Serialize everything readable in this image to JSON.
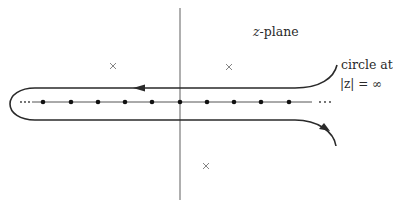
{
  "diagram": {
    "title": "z-plane",
    "plane_label": {
      "var": "z",
      "rest": "-plane"
    },
    "annotation": {
      "line1": "circle at",
      "line2": "|z| = ∞"
    },
    "axes": {
      "imaginary_axis": {
        "x": 180,
        "y1": 8,
        "y2": 200,
        "color": "#7a7a7a"
      },
      "real_axis": {
        "y": 102,
        "x1": 32,
        "x2": 312,
        "color": "#555555"
      }
    },
    "real_axis_points": [
      43,
      71,
      98,
      125,
      152,
      180,
      207,
      234,
      261,
      289
    ],
    "ellipsis_left": "···",
    "ellipsis_right": "···",
    "poles": [
      {
        "x": 113,
        "y": 66,
        "symbol": "×"
      },
      {
        "x": 229,
        "y": 67,
        "symbol": "×"
      },
      {
        "x": 206,
        "y": 166,
        "symbol": "×"
      }
    ],
    "contour": {
      "upper_y": 88,
      "lower_y": 120,
      "left_cap_x": 10,
      "color": "#2a2a2a",
      "direction": "clockwise around real axis (upper leftward, lower rightward)"
    }
  }
}
